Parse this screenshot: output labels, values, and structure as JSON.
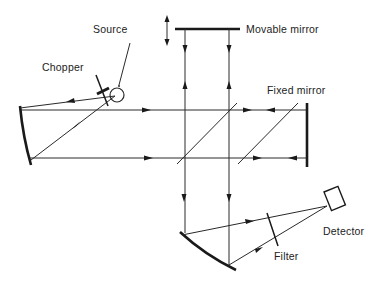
{
  "diagram": {
    "labels": {
      "source": "Source",
      "chopper": "Chopper",
      "movable_mirror": "Movable mirror",
      "fixed_mirror": "Fixed mirror",
      "detector": "Detector",
      "filter": "Filter"
    },
    "colors": {
      "line": "#2a2a2a",
      "text": "#222222",
      "background": "#ffffff"
    }
  }
}
